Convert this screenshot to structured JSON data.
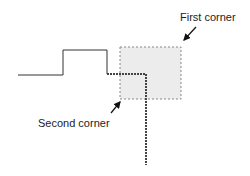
{
  "labels": {
    "first_corner": "First corner",
    "second_corner": "Second corner"
  },
  "colors": {
    "line": "#333333",
    "selection_fill": "#ececec",
    "selection_border": "#888888",
    "selected_segment": "#444444"
  }
}
